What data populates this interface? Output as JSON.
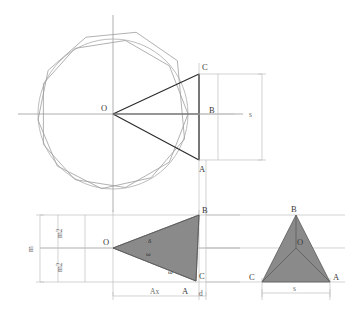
{
  "figure": {
    "background_color": "#ffffff",
    "colors": {
      "polygon_stroke": "#9a9a9a",
      "circle_stroke": "#a8a8a8",
      "axis_stroke": "#8f8f8f",
      "construction_stroke": "#b4b4b4",
      "heavy_stroke": "#2b2b2b",
      "triangle_fill": "#8a8a8a",
      "triangle_stroke": "#5a5a5a",
      "label_color": "#3a3a3a",
      "dim_label_color": "#6b6b6b"
    }
  },
  "top_view": {
    "center_label": "O",
    "point_labels": {
      "A": "A",
      "B": "B",
      "C": "C"
    },
    "dimension_label": "s",
    "polygon_sides": 9,
    "polygon_count": 2,
    "description": "Two overlapping nonagons inscribed in a circle with wedge O-C-B-A highlighted"
  },
  "front_view": {
    "center_label": "O",
    "point_labels": {
      "A": "A",
      "B": "B",
      "C": "C"
    },
    "angle_labels": {
      "delta": "δ",
      "omega_upper": "ω",
      "omega_lower": "ω"
    },
    "dimension_labels": {
      "height_total": "m",
      "height_upper_half": "m2",
      "height_lower_half": "m2",
      "width_ax": "Ax",
      "width_d": "d"
    }
  },
  "side_view": {
    "center_label": "O",
    "point_labels": {
      "A": "A",
      "B": "B",
      "C": "C"
    },
    "dimension_label": "s"
  }
}
